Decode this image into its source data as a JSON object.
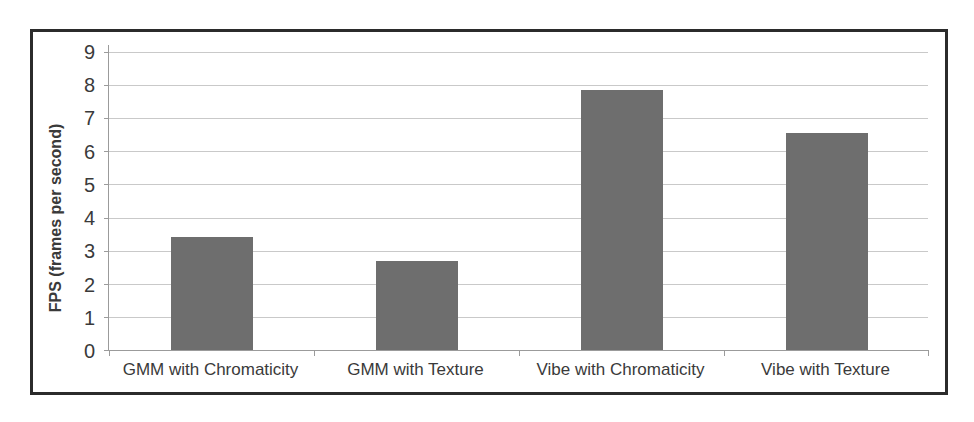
{
  "chart_data": {
    "type": "bar",
    "categories": [
      "GMM with Chromaticity",
      "GMM with Texture",
      "Vibe with Chromaticity",
      "Vibe with Texture"
    ],
    "values": [
      3.4,
      2.7,
      7.85,
      6.55
    ],
    "title": "",
    "xlabel": "",
    "ylabel": "FPS (frames per second)",
    "ylim": [
      0,
      9
    ],
    "ytick_step": 1,
    "grid": true,
    "legend_position": "none",
    "bar_color": "#6e6e6e",
    "gridline_color": "#c9c9c9",
    "axis_color": "#9b9b9b",
    "text_color": "#3a3a3a",
    "frame_border_color": "#2b2b2b"
  }
}
